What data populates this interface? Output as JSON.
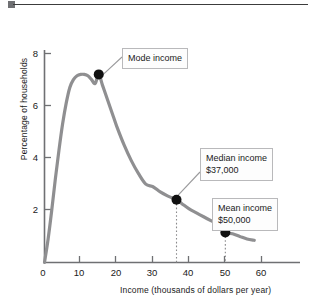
{
  "figure": {
    "top_rule_marker": "square-bullet"
  },
  "chart_data": {
    "type": "line",
    "title": "",
    "xlabel": "Income (thousands of dollars per year)",
    "ylabel": "Percentage of households",
    "xlim": [
      0,
      70
    ],
    "ylim": [
      0,
      8.8
    ],
    "xticks": [
      0,
      10,
      20,
      30,
      40,
      50,
      60
    ],
    "xtick_labels": [
      "0",
      "10",
      "20",
      "30",
      "40",
      "50",
      "60"
    ],
    "yticks": [
      2,
      4,
      6,
      8
    ],
    "ytick_labels": [
      "2",
      "4",
      "6",
      "8"
    ],
    "grid": false,
    "legend": "none",
    "series": [
      {
        "name": "Income distribution",
        "color": "#8f8f91",
        "x": [
          0,
          1,
          2,
          3,
          4,
          5,
          6,
          7,
          8,
          9,
          10,
          11,
          12,
          13,
          14,
          15,
          16,
          17,
          18,
          19,
          20,
          22,
          24,
          26,
          28,
          30,
          32,
          34,
          36.5,
          38,
          40,
          42,
          44,
          46,
          48,
          50,
          52,
          54,
          56,
          58
        ],
        "y": [
          0,
          0.9,
          2.0,
          3.2,
          4.3,
          5.3,
          6.1,
          6.7,
          7.0,
          7.15,
          7.2,
          7.2,
          7.15,
          7.0,
          6.85,
          7.2,
          6.8,
          6.4,
          6.0,
          5.6,
          5.2,
          4.5,
          3.9,
          3.4,
          3.0,
          2.9,
          2.7,
          2.55,
          2.4,
          2.25,
          2.05,
          1.9,
          1.75,
          1.6,
          1.45,
          1.15,
          1.1,
          1.0,
          0.9,
          0.85
        ]
      }
    ],
    "annotations": [
      {
        "id": "mode",
        "label": "Mode income",
        "value_label": "",
        "point": {
          "x": 15,
          "y": 7.2
        },
        "marker": "filled-circle",
        "has_dropline": false
      },
      {
        "id": "median",
        "label": "Median income",
        "value_label": "$37,000",
        "point": {
          "x": 36.5,
          "y": 2.4
        },
        "marker": "filled-circle",
        "has_dropline": true
      },
      {
        "id": "mean",
        "label": "Mean income",
        "value_label": "$50,000",
        "point": {
          "x": 50,
          "y": 1.15
        },
        "marker": "filled-circle",
        "has_dropline": true
      }
    ],
    "colors": {
      "curve": "#8f8f91",
      "axis": "#6f7073",
      "marker": "#111111",
      "leader": "#9a9a9c",
      "dropline": "#8a8a8c",
      "callout_border": "#b9b9bb",
      "callout_fill": "#fdfdfd"
    }
  }
}
